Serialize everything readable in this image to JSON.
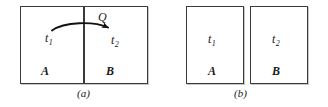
{
  "figure": {
    "panels": [
      {
        "caption": "(a)",
        "boxes": [
          {
            "system_label": "A",
            "temperature_label": "t",
            "temperature_subscript": "1"
          },
          {
            "system_label": "B",
            "temperature_label": "t",
            "temperature_subscript": "2"
          }
        ],
        "annotation": {
          "heat_label": "Q",
          "arrow_direction": "left-to-right",
          "icon": "curved-arrow-icon"
        }
      },
      {
        "caption": "(b)",
        "boxes": [
          {
            "system_label": "A",
            "temperature_label": "t",
            "temperature_subscript": "1"
          },
          {
            "system_label": "B",
            "temperature_label": "t",
            "temperature_subscript": "2"
          }
        ]
      }
    ]
  },
  "colors": {
    "background": "#ffffff",
    "stroke": "#3a3a3a",
    "shadow": "#c9c9c9",
    "text": "#1a1a1a"
  }
}
